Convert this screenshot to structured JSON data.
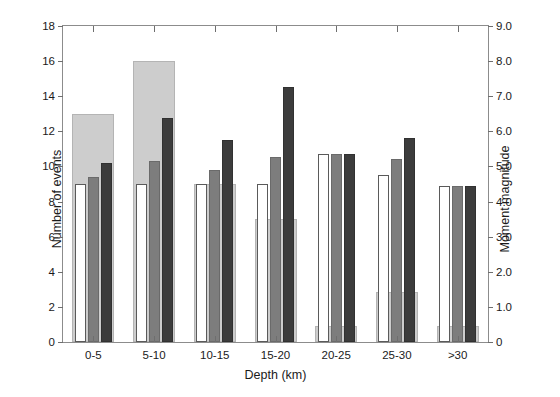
{
  "chart_data": {
    "type": "bar",
    "title": "",
    "subtitle": "",
    "xlabel": "Depth (km)",
    "ylabel": "Number of events",
    "ylabel_right": "Moment magnitude",
    "categories": [
      "0-5",
      "5-10",
      "10-15",
      "15-20",
      "20-25",
      "25-30",
      ">30"
    ],
    "ylim": [
      0,
      18
    ],
    "ylim_right": [
      0,
      9.0
    ],
    "yticks": [
      0,
      2,
      4,
      6,
      8,
      10,
      12,
      14,
      16,
      18
    ],
    "ytick_labels": [
      "0",
      "2",
      "4",
      "6",
      "8",
      "10",
      "12",
      "14",
      "16",
      "18"
    ],
    "yticks_right": [
      0,
      1.0,
      2.0,
      3.0,
      4.0,
      5.0,
      6.0,
      7.0,
      8.0,
      9.0
    ],
    "ytick_labels_right": [
      "0",
      "1.0",
      "2.0",
      "3.0",
      "4.0",
      "5.0",
      "6.0",
      "7.0",
      "8.0",
      "9.0"
    ],
    "grid": false,
    "legend": "none",
    "axis": "dual-y",
    "series": [
      {
        "name": "Number of events",
        "axis": "left",
        "style": "wide-background-bar",
        "color": "#cdcdcd",
        "values": [
          13,
          16,
          9,
          7,
          0.9,
          2.85,
          0.9
        ]
      },
      {
        "name": "Minimum moment magnitude",
        "axis": "right",
        "style": "white-bar",
        "color": "#ffffff",
        "values": [
          4.5,
          4.5,
          4.5,
          4.5,
          5.35,
          4.75,
          4.45
        ]
      },
      {
        "name": "Mean moment magnitude",
        "axis": "right",
        "style": "gray-bar",
        "color": "#7d7d7d",
        "values": [
          4.7,
          5.15,
          4.9,
          5.28,
          5.35,
          5.2,
          4.45
        ]
      },
      {
        "name": "Maximum moment magnitude",
        "axis": "right",
        "style": "dark-bar",
        "color": "#3c3c3c",
        "values": [
          5.1,
          6.38,
          5.75,
          7.25,
          5.35,
          5.8,
          4.45
        ]
      }
    ]
  },
  "figure": {
    "background_color": "#ffffff",
    "frame_color": "#8c8c8c",
    "tick_color": "#6e6e6e",
    "text_color": "#1a1a1a"
  }
}
